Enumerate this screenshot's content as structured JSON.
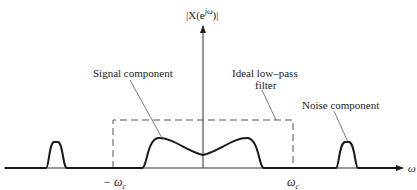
{
  "figure": {
    "y_axis_label": "|X(e^{jω})|",
    "y_axis_label_parts": {
      "prefix": "|X(e",
      "sup": "jω",
      "suffix": ")|"
    },
    "x_axis_label": "ω",
    "x_ticks": {
      "neg_cutoff": "− ω",
      "neg_cutoff_sub": "c",
      "pos_cutoff": "ω",
      "pos_cutoff_sub": "c"
    },
    "annotations": {
      "signal": "Signal component",
      "filter_line1": "Ideal low–pass",
      "filter_line2": "filter",
      "noise": "Noise component"
    },
    "colors": {
      "curve": "#1a1a1a",
      "axis": "#333333",
      "dashed": "#555555"
    }
  }
}
